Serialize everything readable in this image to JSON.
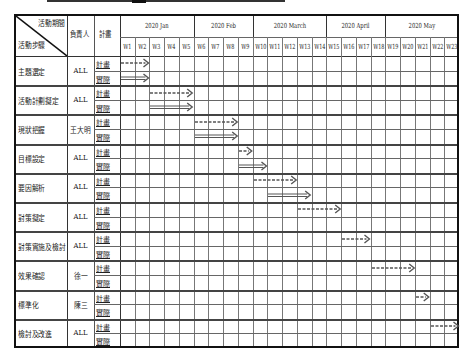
{
  "header": {
    "corner_top": "活動期間",
    "corner_bottom": "活動步驟",
    "owner_header": "負責人",
    "plan_header": "計畫"
  },
  "months": [
    {
      "label": "2020 Jan",
      "start_week": 1,
      "end_week": 5
    },
    {
      "label": "2020 Feb",
      "start_week": 6,
      "end_week": 9
    },
    {
      "label": "2020 March",
      "start_week": 10,
      "end_week": 14
    },
    {
      "label": "2020 April",
      "start_week": 15,
      "end_week": 18
    },
    {
      "label": "2020 May",
      "start_week": 19,
      "end_week": 23
    }
  ],
  "weeks": [
    "W1",
    "W2",
    "W3",
    "W4",
    "W5",
    "W6",
    "W7",
    "W8",
    "W9",
    "W10",
    "W11",
    "W12",
    "W13",
    "W14",
    "W15",
    "W16",
    "W17",
    "W18",
    "W19",
    "W20",
    "W21",
    "W22",
    "W23"
  ],
  "sub_rows": {
    "plan": "計畫",
    "actual": "實際"
  },
  "rows": [
    {
      "step": "主題選定",
      "owner": "ALL",
      "plan": "計畫",
      "actual": "實際"
    },
    {
      "step": "活動計劃擬定",
      "owner": "ALL",
      "plan": "計畫",
      "actual": "實際"
    },
    {
      "step": "現狀把握",
      "owner": "王大明",
      "plan": "計畫",
      "actual": "實際"
    },
    {
      "step": "目標設定",
      "owner": "ALL",
      "plan": "計畫",
      "actual": "實際"
    },
    {
      "step": "要因解析",
      "owner": "ALL",
      "plan": "計畫",
      "actual": "實際"
    },
    {
      "step": "對策擬定",
      "owner": "ALL",
      "plan": "計畫",
      "actual": "實際"
    },
    {
      "step": "對策實施及檢討",
      "owner": "ALL",
      "plan": "計畫",
      "actual": "實際"
    },
    {
      "step": "效果確認",
      "owner": "徐一",
      "plan": "計畫",
      "actual": "實際"
    },
    {
      "step": "標準化",
      "owner": "陳三",
      "plan": "計畫",
      "actual": "實際"
    },
    {
      "step": "檢討及改進",
      "owner": "ALL",
      "plan": "計畫",
      "actual": "實際"
    }
  ],
  "chart_data": {
    "type": "gantt",
    "title": "",
    "x_unit": "week",
    "categories": [
      "主題選定",
      "活動計劃擬定",
      "現狀把握",
      "目標設定",
      "要因解析",
      "對策擬定",
      "對策實施及檢討",
      "效果確認",
      "標準化",
      "檢討及改進"
    ],
    "owners": [
      "ALL",
      "ALL",
      "王大明",
      "ALL",
      "ALL",
      "ALL",
      "ALL",
      "徐一",
      "陳三",
      "ALL"
    ],
    "series": [
      {
        "name": "計畫",
        "style": "dashed-arrow",
        "values": [
          [
            1,
            2
          ],
          [
            3,
            5
          ],
          [
            6,
            8
          ],
          [
            9,
            9
          ],
          [
            10,
            12
          ],
          [
            13,
            15
          ],
          [
            16,
            17
          ],
          [
            18,
            20
          ],
          [
            21,
            21
          ],
          [
            22,
            23
          ]
        ]
      },
      {
        "name": "實際",
        "style": "solid-arrow",
        "values": [
          [
            1,
            2
          ],
          [
            3,
            5
          ],
          [
            6,
            8
          ],
          [
            9,
            10
          ],
          [
            11,
            13
          ],
          null,
          null,
          null,
          null,
          null
        ]
      }
    ],
    "x_ticks": [
      "W1",
      "W2",
      "W3",
      "W4",
      "W5",
      "W6",
      "W7",
      "W8",
      "W9",
      "W10",
      "W11",
      "W12",
      "W13",
      "W14",
      "W15",
      "W16",
      "W17",
      "W18",
      "W19",
      "W20",
      "W21",
      "W22",
      "W23"
    ],
    "x_groups": [
      "2020 Jan",
      "2020 Feb",
      "2020 March",
      "2020 April",
      "2020 May"
    ],
    "grid": true
  }
}
